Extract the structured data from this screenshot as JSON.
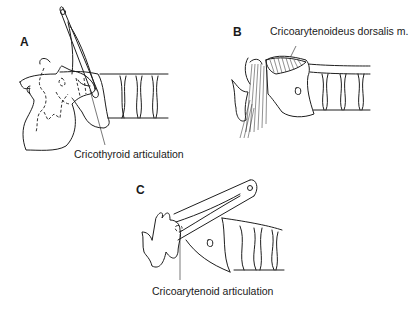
{
  "figure": {
    "panels": [
      {
        "label": "A",
        "caption": "Cricothyroid articulation"
      },
      {
        "label": "B",
        "caption": "Cricoarytenoideus dorsalis m."
      },
      {
        "label": "C",
        "caption": "Cricoarytenoid articulation"
      }
    ]
  }
}
